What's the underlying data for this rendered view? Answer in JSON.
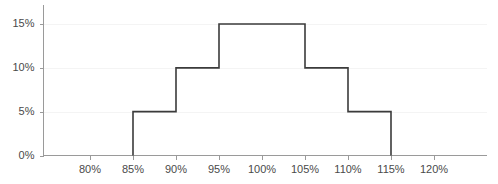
{
  "chart_data": {
    "type": "line",
    "title": "",
    "subtitle": "",
    "xlabel": "",
    "ylabel": "",
    "grid": true,
    "legend": null,
    "style": "step-outline-histogram",
    "xlim": [
      77.5,
      122.5
    ],
    "ylim": [
      0,
      16.5
    ],
    "x_tick_labels": [
      "80%",
      "85%",
      "90%",
      "95%",
      "100%",
      "105%",
      "110%",
      "115%",
      "120%"
    ],
    "x_tick_values": [
      80,
      85,
      90,
      95,
      100,
      105,
      110,
      115,
      120
    ],
    "y_tick_labels": [
      "0%",
      "5%",
      "10%",
      "15%"
    ],
    "y_tick_values": [
      0,
      5,
      10,
      15
    ],
    "bin_edges": [
      85,
      90,
      95,
      100,
      105,
      110,
      115
    ],
    "categories": [
      "85%-90%",
      "90%-95%",
      "95%-100%",
      "100%-105%",
      "105%-110%",
      "110%-115%"
    ],
    "values": [
      5,
      10,
      15,
      15,
      10,
      5
    ],
    "series": [
      {
        "name": "distribution",
        "color": "#3b3b3b",
        "values": [
          5,
          10,
          15,
          15,
          10,
          5
        ]
      }
    ],
    "step_points": [
      [
        85,
        0
      ],
      [
        85,
        5
      ],
      [
        90,
        5
      ],
      [
        90,
        10
      ],
      [
        95,
        10
      ],
      [
        95,
        15
      ],
      [
        105,
        15
      ],
      [
        105,
        10
      ],
      [
        110,
        10
      ],
      [
        110,
        5
      ],
      [
        115,
        5
      ],
      [
        115,
        0
      ]
    ],
    "colors": {
      "line": "#3b3b3b",
      "axis": "#9a9a9a",
      "grid": "#f4f4f4",
      "tick_text": "#4a4a4a",
      "background": "#ffffff"
    }
  }
}
